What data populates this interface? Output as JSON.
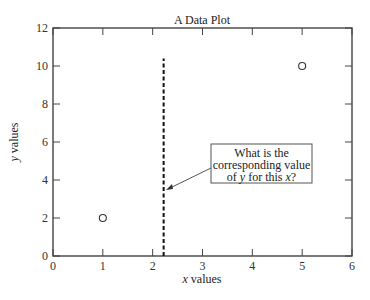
{
  "chart_data": {
    "type": "scatter",
    "title": "A Data Plot",
    "xlabel": "x values",
    "ylabel": "y values",
    "xlim": [
      0,
      6
    ],
    "ylim": [
      0,
      12
    ],
    "xticks": [
      "0",
      "1",
      "2",
      "3",
      "4",
      "5",
      "6"
    ],
    "yticks": [
      "0",
      "2",
      "4",
      "6",
      "8",
      "10",
      "12"
    ],
    "grid": false,
    "series": [
      {
        "name": "data",
        "marker": "open-circle",
        "x": [
          1,
          5
        ],
        "y": [
          2,
          10
        ]
      }
    ],
    "vertical_line": {
      "x": 2.22,
      "y_from": 0,
      "y_to": 10.4,
      "style": "dashed"
    },
    "annotation": {
      "lines": [
        "What is the",
        "corresponding value",
        "of y for this x?"
      ],
      "arrow_to": {
        "x": 2.25,
        "y": 3.5
      }
    }
  }
}
